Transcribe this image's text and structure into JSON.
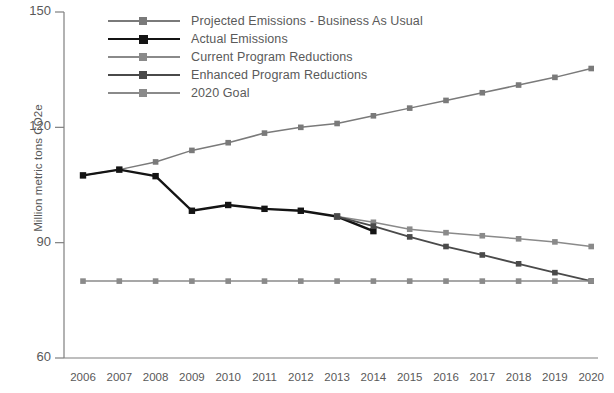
{
  "chart_data": {
    "type": "line",
    "title": "",
    "xlabel": "",
    "ylabel": "Million metric tons CO2e",
    "categories": [
      "2006",
      "2007",
      "2008",
      "2009",
      "2010",
      "2011",
      "2012",
      "2013",
      "2014",
      "2015",
      "2016",
      "2017",
      "2018",
      "2019",
      "2020"
    ],
    "x": [
      2006,
      2007,
      2008,
      2009,
      2010,
      2011,
      2012,
      2013,
      2014,
      2015,
      2016,
      2017,
      2018,
      2019,
      2020
    ],
    "ylim": [
      60,
      150
    ],
    "yticks": [
      60,
      90,
      120,
      150
    ],
    "grid": false,
    "legend_position": "top-left",
    "series": [
      {
        "name": "Projected Emissions - Business As Usual",
        "color": "#7a7a7a",
        "values": [
          107.5,
          109.0,
          111.0,
          114.0,
          116.0,
          118.5,
          120.0,
          121.0,
          123.0,
          125.0,
          127.0,
          129.0,
          131.0,
          133.0,
          135.3
        ]
      },
      {
        "name": "Actual Emissions",
        "color": "#141414",
        "values": [
          107.5,
          109.0,
          107.3,
          98.3,
          99.8,
          98.8,
          98.3,
          96.8,
          93.0,
          null,
          null,
          null,
          null,
          null,
          null
        ]
      },
      {
        "name": "Current Program Reductions",
        "color": "#8a8a8a",
        "values": [
          null,
          null,
          null,
          null,
          null,
          null,
          null,
          96.8,
          95.3,
          93.5,
          92.6,
          91.8,
          91.0,
          90.2,
          89.0
        ]
      },
      {
        "name": "Enhanced Program Reductions",
        "color": "#4a4a4a",
        "values": [
          null,
          null,
          null,
          null,
          null,
          null,
          null,
          96.8,
          94.3,
          91.5,
          89.0,
          86.8,
          84.5,
          82.2,
          80.0
        ]
      },
      {
        "name": "2020 Goal",
        "color": "#8a8a8a",
        "values": [
          80.0,
          80.0,
          80.0,
          80.0,
          80.0,
          80.0,
          80.0,
          80.0,
          80.0,
          80.0,
          80.0,
          80.0,
          80.0,
          80.0,
          80.0
        ]
      }
    ]
  },
  "axis": {
    "y_label": "Million metric tons CO2e",
    "y_ticks": [
      "150",
      "120",
      "90",
      "60"
    ],
    "x_ticks": [
      "2006",
      "2007",
      "2008",
      "2009",
      "2010",
      "2011",
      "2012",
      "2013",
      "2014",
      "2015",
      "2016",
      "2017",
      "2018",
      "2019",
      "2020"
    ]
  },
  "legend": {
    "items": [
      {
        "label": "Projected Emissions - Business As Usual",
        "color": "#7a7a7a"
      },
      {
        "label": "Actual Emissions",
        "color": "#141414"
      },
      {
        "label": "Current Program Reductions",
        "color": "#8a8a8a"
      },
      {
        "label": "Enhanced Program Reductions",
        "color": "#4a4a4a"
      },
      {
        "label": "2020 Goal",
        "color": "#8a8a8a"
      }
    ]
  },
  "colors": {
    "axis": "#7f7f7f",
    "text": "#595959",
    "background": "#ffffff"
  }
}
